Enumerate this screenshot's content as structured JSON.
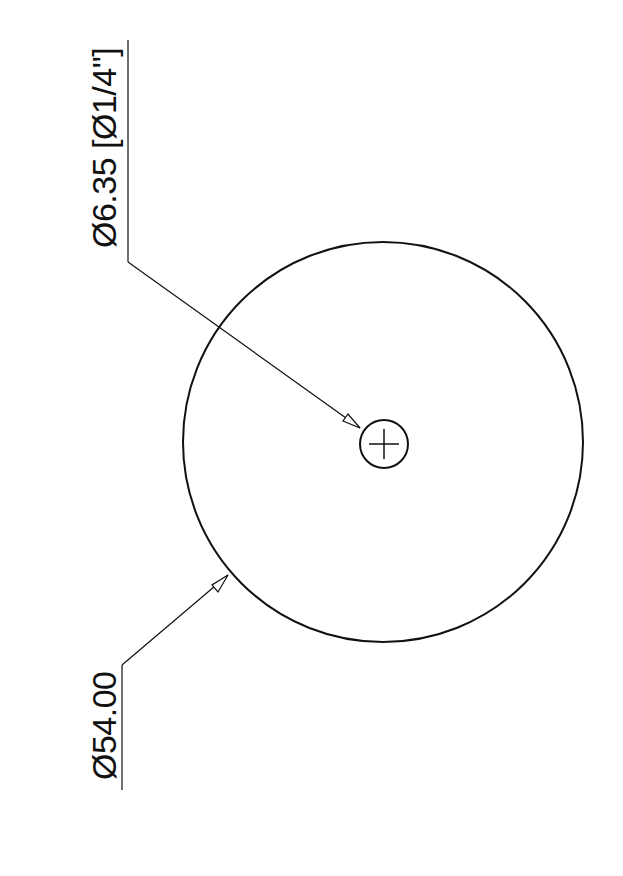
{
  "drawing": {
    "outer_diameter_label": "Ø54.00",
    "hole_diameter_label": "Ø6.35 [Ø1/4\"]",
    "stroke_color": "#111111",
    "background_color": "#ffffff"
  }
}
